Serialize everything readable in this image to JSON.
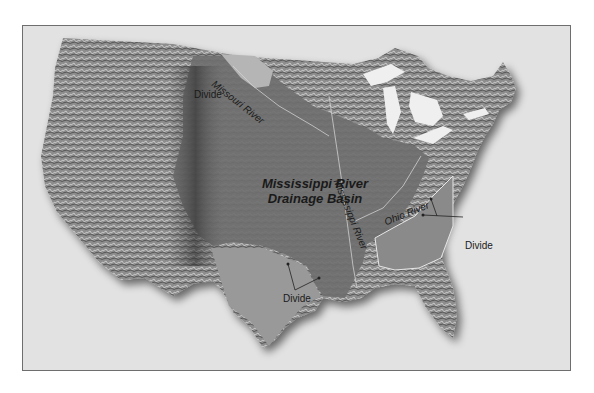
{
  "map": {
    "title_line1": "Mississippi River",
    "title_line2": "Drainage Basin",
    "labels": {
      "missouri_river": "Missouri River",
      "mississippi_river": "Mississippi River",
      "ohio_river": "Ohio River",
      "divide_northwest": "Divide",
      "divide_southwest": "Divide",
      "divide_east": "Divide"
    },
    "colors": {
      "background": "#e2e2e2",
      "frame_border": "#6e6e6e",
      "land_west": "#8a8a8a",
      "basin": "#6f6f6f",
      "outside_basin_east": "#848484",
      "lakes": "#efefef"
    }
  }
}
